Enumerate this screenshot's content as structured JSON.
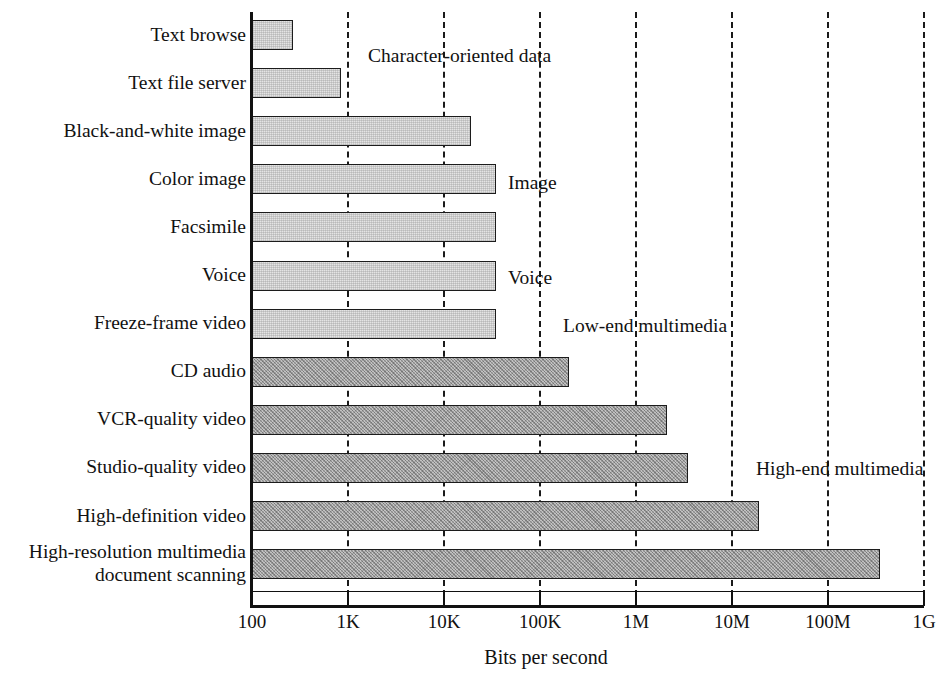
{
  "chart_data": {
    "type": "bar",
    "orientation": "horizontal",
    "title": "",
    "xlabel": "Bits per second",
    "ylabel": "",
    "xscale": "log",
    "xlim": [
      100,
      1000000000
    ],
    "grid": true,
    "grid_axis": "x",
    "legend": "none",
    "xticklabels": [
      "100",
      "1K",
      "10K",
      "100K",
      "1M",
      "10M",
      "100M",
      "1G"
    ],
    "xtickvalues": [
      100,
      1000,
      10000,
      100000,
      1000000,
      10000000,
      100000000,
      1000000000
    ],
    "categories": [
      "Text browse",
      "Text file server",
      "Black-and-white image",
      "Color image",
      "Facsimile",
      "Voice",
      "Freeze-frame video",
      "CD audio",
      "VCR-quality video",
      "Studio-quality video",
      "High-definition video",
      "High-resolution multimedia document scanning"
    ],
    "values": [
      270,
      850,
      19000,
      35000,
      35000,
      35000,
      35000,
      200000,
      2100000,
      3500000,
      19000000,
      350000000
    ],
    "value_labels": [
      "~270 bps",
      "~850 bps",
      "~19 Kbps",
      "~35 Kbps",
      "~35 Kbps",
      "~35 Kbps",
      "~35 Kbps",
      "~200 Kbps",
      "~2.1 Mbps",
      "~3.5 Mbps",
      "~19 Mbps",
      "~350 Mbps"
    ],
    "bar_styles": [
      "light",
      "light",
      "light",
      "light",
      "light",
      "light",
      "light",
      "dark",
      "dark",
      "dark",
      "dark",
      "dark"
    ],
    "annotations": [
      {
        "text": "Character-oriented data",
        "x_px": 368,
        "y_px": 45
      },
      {
        "text": "Image",
        "x_px": 508,
        "y_px": 172
      },
      {
        "text": "Voice",
        "x_px": 508,
        "y_px": 267
      },
      {
        "text": "Low-end multimedia",
        "x_px": 563,
        "y_px": 315
      },
      {
        "text": "High-end multimedia",
        "x_px": 756,
        "y_px": 458
      }
    ],
    "colors": {
      "light_bar_fill": "#e4e4e4",
      "dark_bar_fill": "#a9a9a9",
      "bar_edge": "#1c1c1c",
      "axis": "#111111",
      "gridline": "#1a1a1a",
      "background": "#ffffff",
      "text": "#111111"
    }
  },
  "category_labels": [
    {
      "lines": [
        "Text browse"
      ]
    },
    {
      "lines": [
        "Text file server"
      ]
    },
    {
      "lines": [
        "Black-and-white image"
      ]
    },
    {
      "lines": [
        "Color image"
      ]
    },
    {
      "lines": [
        "Facsimile"
      ]
    },
    {
      "lines": [
        "Voice"
      ]
    },
    {
      "lines": [
        "Freeze-frame video"
      ]
    },
    {
      "lines": [
        "CD audio"
      ]
    },
    {
      "lines": [
        "VCR-quality video"
      ]
    },
    {
      "lines": [
        "Studio-quality video"
      ]
    },
    {
      "lines": [
        "High-definition video"
      ]
    },
    {
      "lines": [
        "High-resolution multimedia",
        "document scanning"
      ]
    }
  ]
}
